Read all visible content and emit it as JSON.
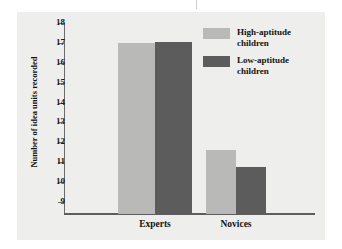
{
  "figure": {
    "panel_background": "#eeeeec",
    "page_background": "#ffffff"
  },
  "chart_data": {
    "type": "bar",
    "title": "",
    "subtitle": "",
    "xlabel": "",
    "ylabel": "Number of idea units recorded",
    "categories": [
      "Experts",
      "Novices"
    ],
    "series": [
      {
        "name": "High-aptitude children",
        "color": "#b9b9b7",
        "values": [
          17.0,
          11.6
        ]
      },
      {
        "name": "Low-aptitude children",
        "color": "#5c5c5c",
        "values": [
          17.05,
          10.75
        ]
      }
    ],
    "ylim": [
      8.4,
      18
    ],
    "yticks": [
      18,
      17,
      16,
      15,
      14,
      13,
      12,
      11,
      10,
      9
    ],
    "ytick_labels": [
      "18",
      "17",
      "16",
      "15",
      "14",
      "13",
      "12",
      "11",
      "10",
      "9"
    ],
    "grid": false,
    "legend_position": "top-right",
    "legend_entries": [
      {
        "label_line1": "High-aptitude",
        "label_line2": "children",
        "swatch": "#b9b9b7"
      },
      {
        "label_line1": "Low-aptitude",
        "label_line2": "children",
        "swatch": "#5c5c5c"
      }
    ],
    "axis_color": "#5d5d5d"
  },
  "legend": {
    "entries": [
      {
        "text": "High-aptitude\nchildren"
      },
      {
        "text": "Low-aptitude\nchildren"
      }
    ]
  },
  "axes": {
    "y_title": "Number of idea units recorded",
    "y_ticks": [
      "18",
      "17",
      "16",
      "15",
      "14",
      "13",
      "12",
      "11",
      "10",
      "9"
    ],
    "x_categories": [
      "Experts",
      "Novices"
    ]
  }
}
